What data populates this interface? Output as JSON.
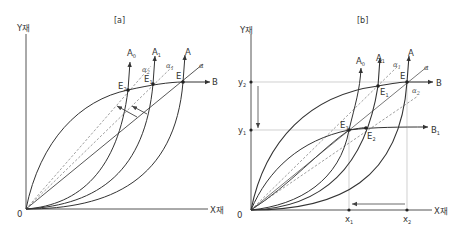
{
  "panels": [
    {
      "id": "a",
      "title": "[a]",
      "y_axis_label": "Y재",
      "x_axis_label": "X재",
      "origin_label": "0",
      "curve_labels": {
        "A0": "A",
        "A0_sub": "0",
        "A1": "A",
        "A1_sub": "1",
        "A": "A",
        "B": "B"
      },
      "point_labels": {
        "E2": "E",
        "E2_sub": "2",
        "E1": "E",
        "E1_sub": "1",
        "E": "E"
      },
      "ray_labels": {
        "alpha2": "α",
        "alpha2_sub": "2",
        "alpha1": "α",
        "alpha1_sub": "1",
        "alpha": "α"
      }
    },
    {
      "id": "b",
      "title": "[b]",
      "y_axis_label": "Y재",
      "x_axis_label": "X재",
      "origin_label": "0",
      "y_ticks": {
        "y2": "y",
        "y2_sub": "2",
        "y1": "y",
        "y1_sub": "1"
      },
      "x_ticks": {
        "x1": "x",
        "x1_sub": "1",
        "x2": "x",
        "x2_sub": "2"
      },
      "curve_labels": {
        "A0": "A",
        "A0_sub": "0",
        "A1": "A",
        "A1_sub": "1",
        "A": "A",
        "B": "B",
        "B1": "B",
        "B1_sub": "1"
      },
      "point_labels": {
        "E3": "E",
        "E3_sub": "3",
        "E2": "E",
        "E2_sub": "2",
        "E1": "E",
        "E1_sub": "1",
        "E": "E"
      },
      "ray_labels": {
        "alpha1": "α",
        "alpha1_sub": "1",
        "alpha": "α",
        "alpha2": "α",
        "alpha2_sub": "2"
      }
    }
  ],
  "colors": {
    "line": "#333333",
    "guide": "#bbbbbb",
    "dashed": "#777777"
  }
}
